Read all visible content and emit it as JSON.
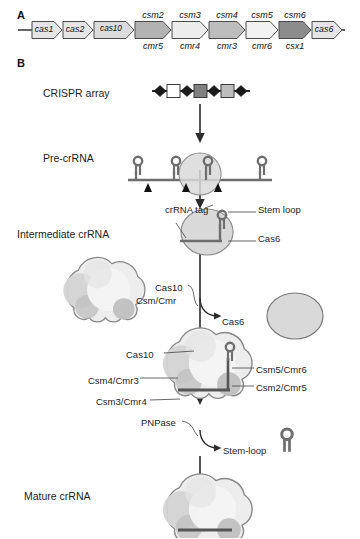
{
  "figure": {
    "panels": {
      "a_letter": "A",
      "b_letter": "B"
    },
    "caption_partial": ""
  },
  "panel_a": {
    "operon_genes": [
      {
        "name": "cas1",
        "fill": "#e6e6e6",
        "lower": ""
      },
      {
        "name": "cas2",
        "fill": "#e6e6e6",
        "lower": ""
      },
      {
        "name": "cas10",
        "fill": "#dcdcdc",
        "lower": ""
      },
      {
        "name": "csm2",
        "fill": "#b2b2b2",
        "lower": "cmr5"
      },
      {
        "name": "csm3",
        "fill": "#ececec",
        "lower": "cmr4"
      },
      {
        "name": "csm4",
        "fill": "#bdbdbd",
        "lower": "cmr3"
      },
      {
        "name": "csm5",
        "fill": "#f2f2f2",
        "lower": "cmr6"
      },
      {
        "name": "csm6",
        "fill": "#8c8c8c",
        "lower": "csx1"
      },
      {
        "name": "cas6",
        "fill": "#e6e6e6",
        "lower": ""
      }
    ]
  },
  "panel_b": {
    "stages": [
      {
        "id": "crispr-array",
        "label": "CRISPR array"
      },
      {
        "id": "pre-crrna",
        "label": "Pre-crRNA"
      },
      {
        "id": "intermediate-crrna",
        "label": "Intermediate crRNA"
      },
      {
        "id": "mature-crrna",
        "label": "Mature crRNA"
      }
    ],
    "crispr_array": {
      "repeat_count": 4,
      "spacers": [
        {
          "fill": "#ffffff"
        },
        {
          "fill": "#808080"
        },
        {
          "fill": "#bdbdbd"
        }
      ],
      "repeat_fill": "#1a1a1a"
    },
    "pre_crrna": {
      "stem_loop_count": 4,
      "cleavage_marker_count": 3,
      "cas6_on_loop_index": 3
    },
    "callouts": {
      "crrna_tag": "crRNA tag",
      "stem_loop": "Stem loop",
      "cas6_label": "Cas6",
      "cas10_assembly": "Cas10",
      "csm_cmr_assembly": "Csm/Cmr",
      "cas6_released": "Cas6",
      "cas10": "Cas10",
      "csm4_cmr3": "Csm4/Cmr3",
      "csm3_cmr4": "Csm3/Cmr4",
      "csm5_cmr6": "Csm5/Cmr6",
      "csm2_cmr5": "Csm2/Cmr5",
      "pnpase": "PNPase",
      "stem_loop_released": "Stem-loop"
    }
  },
  "colors": {
    "stroke": "#4d4d4d",
    "dark_stroke": "#333333",
    "text": "#1c1c1c",
    "blob_outline": "#8a8a8a",
    "blob_light": "#ededed",
    "blob_mid": "#d4d4d4",
    "blob_dark": "#c0c0c0",
    "rna_line": "#6e6e6e",
    "cas6_fill": "#d9d9d9"
  }
}
